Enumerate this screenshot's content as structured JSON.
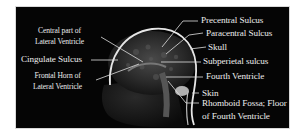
{
  "figure": {
    "background_color": "#050505",
    "text_color": "#ececec",
    "left_labels": [
      {
        "id": "central-part-lateral-ventricle",
        "line1": "Central part of",
        "line2": "Lateral Ventricle"
      },
      {
        "id": "cingulate-sulcus",
        "line1": "Cingulate Sulcus"
      },
      {
        "id": "frontal-horn-lateral-ventricle",
        "line1": "Frontal Horn of",
        "line2": "Lateral Ventricle"
      }
    ],
    "right_labels": [
      {
        "id": "precentral-sulcus",
        "text": "Precentral Sulcus"
      },
      {
        "id": "paracentral-sulcus",
        "text": "Paracentral Sulcus"
      },
      {
        "id": "skull",
        "text": "Skull"
      },
      {
        "id": "subperietal-sulcus",
        "text": "Subperietal sulcus"
      },
      {
        "id": "fourth-ventricle",
        "text": "Fourth Ventricle"
      },
      {
        "id": "skin",
        "text": "Skin"
      },
      {
        "id": "rhomboid-fossa",
        "line1": "Rhomboid Fossa; Floor",
        "line2": "of Fourth Ventricle"
      }
    ]
  }
}
